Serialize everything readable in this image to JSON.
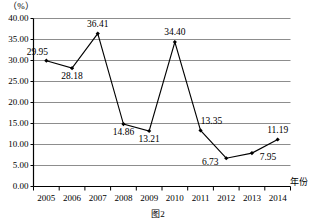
{
  "chart_data": {
    "type": "line",
    "title": "",
    "subtitle": "",
    "xlabel": "年份",
    "ylabel": "",
    "unit_label": "（%）",
    "categories": [
      "2005",
      "2006",
      "2007",
      "2008",
      "2009",
      "2010",
      "2011",
      "2012",
      "2013",
      "2014"
    ],
    "values": [
      29.95,
      28.18,
      36.41,
      14.86,
      13.21,
      34.4,
      13.35,
      6.73,
      7.95,
      11.19
    ],
    "point_labels": [
      "29.95",
      "28.18",
      "36.41",
      "14.86",
      "13.21",
      "34.40",
      "13.35",
      "6.73",
      "7.95",
      "11.19"
    ],
    "label_positions": [
      "above-left",
      "below",
      "above",
      "below",
      "below",
      "above",
      "above-right",
      "left",
      "right",
      "above"
    ],
    "ylim": [
      0,
      40
    ],
    "ytick_values": [
      0,
      5,
      10,
      15,
      20,
      25,
      30,
      35,
      40
    ],
    "ytick_labels": [
      "0.00",
      "5.00",
      "10.00",
      "15.00",
      "20.00",
      "25.00",
      "30.00",
      "35.00",
      "40.00"
    ],
    "grid": true,
    "grid_axis": "y",
    "legend": "none",
    "marker": "filled-diamond",
    "line_color": "#000000",
    "grid_color": "#808080"
  },
  "caption": {
    "text": "图2"
  }
}
